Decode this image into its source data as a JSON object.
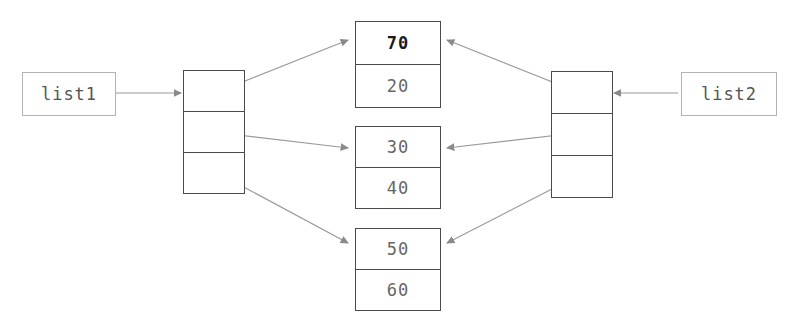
{
  "diagram": {
    "colors": {
      "box_border": "#4a4a4a",
      "label_border": "#b3b3b3",
      "wire": "#9a9a9a",
      "arrowhead": "#8a8a8a",
      "text": "#666666",
      "text_strong": "#1a1a1a",
      "background": "#ffffff"
    },
    "labels": [
      {
        "id": "list1",
        "text": "list1"
      },
      {
        "id": "list2",
        "text": "list2"
      }
    ],
    "pointer_blocks": [
      {
        "id": "left-block",
        "cells": 3
      },
      {
        "id": "right-block",
        "cells": 3
      }
    ],
    "value_boxes": [
      {
        "id": "node-top",
        "slots": [
          {
            "value": "70",
            "emphasis": "bold"
          },
          {
            "value": "20",
            "emphasis": "normal"
          }
        ]
      },
      {
        "id": "node-middle",
        "slots": [
          {
            "value": "30",
            "emphasis": "normal"
          },
          {
            "value": "40",
            "emphasis": "normal"
          }
        ]
      },
      {
        "id": "node-bottom",
        "slots": [
          {
            "value": "50",
            "emphasis": "normal"
          },
          {
            "value": "60",
            "emphasis": "normal"
          }
        ]
      }
    ]
  }
}
